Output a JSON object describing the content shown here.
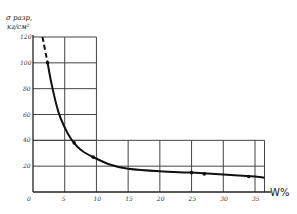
{
  "chart_data": {
    "type": "line",
    "title": "",
    "xlabel": "W%",
    "ylabel": "σ разр, кг/см²",
    "ylabel_line1": "σ разр,",
    "ylabel_line2": "кг/см²",
    "xlim": [
      0,
      37
    ],
    "ylim": [
      0,
      120
    ],
    "x_ticks": [
      "0",
      "5",
      "10",
      "15",
      "20",
      "25",
      "30",
      "35"
    ],
    "y_ticks": [
      "0",
      "20",
      "40",
      "60",
      "80",
      "100",
      "120"
    ],
    "grid": true,
    "legend": null,
    "series": [
      {
        "name": "measured points",
        "style": "markers",
        "x": [
          2.3,
          6.5,
          9.5,
          25,
          27,
          34
        ],
        "y": [
          100,
          38,
          27,
          15,
          14,
          12
        ]
      },
      {
        "name": "fitted curve",
        "style": "solid line",
        "x": [
          2.3,
          3,
          4,
          5,
          6,
          7,
          8,
          9.5,
          12,
          15,
          20,
          25,
          30,
          35,
          36.5
        ],
        "y": [
          100,
          82,
          62,
          50,
          41,
          35,
          31,
          27,
          21.5,
          18,
          16,
          15,
          13.5,
          12,
          11
        ]
      },
      {
        "name": "extrapolation",
        "style": "dashed line",
        "x": [
          1.5,
          2.3
        ],
        "y": [
          120,
          100
        ]
      }
    ]
  }
}
